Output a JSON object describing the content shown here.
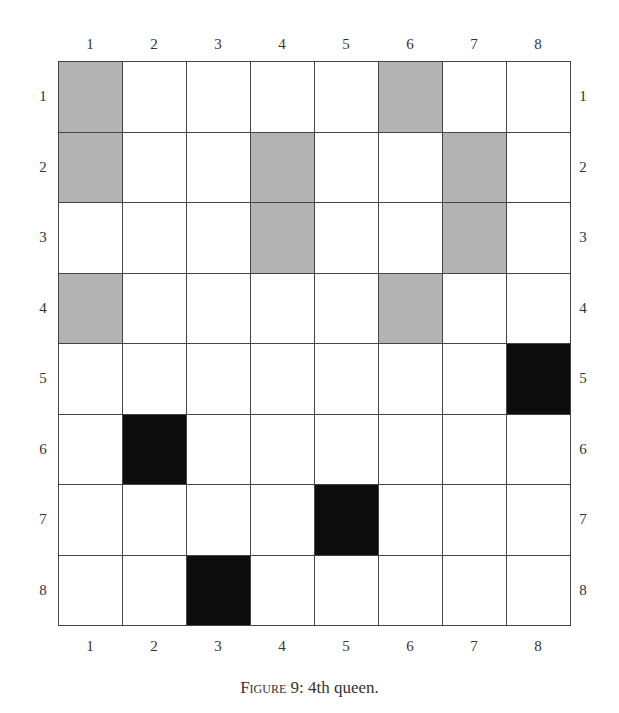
{
  "figure": {
    "caption_prefix": "Figure 9",
    "caption_rest": ": 4th queen.",
    "columns": [
      "1",
      "2",
      "3",
      "4",
      "5",
      "6",
      "7",
      "8"
    ],
    "rows": [
      "1",
      "2",
      "3",
      "4",
      "5",
      "6",
      "7",
      "8"
    ],
    "colors": {
      "gray": "#b3b3b3",
      "black": "#0d0d0d",
      "line": "#444444"
    },
    "board": [
      [
        "gray",
        "white",
        "white",
        "white",
        "white",
        "gray",
        "white",
        "white"
      ],
      [
        "gray",
        "white",
        "white",
        "gray",
        "white",
        "white",
        "gray",
        "white"
      ],
      [
        "white",
        "white",
        "white",
        "gray",
        "white",
        "white",
        "gray",
        "white"
      ],
      [
        "gray",
        "white",
        "white",
        "white",
        "white",
        "gray",
        "white",
        "white"
      ],
      [
        "white",
        "white",
        "white",
        "white",
        "white",
        "white",
        "white",
        "black"
      ],
      [
        "white",
        "black",
        "white",
        "white",
        "white",
        "white",
        "white",
        "white"
      ],
      [
        "white",
        "white",
        "white",
        "white",
        "black",
        "white",
        "white",
        "white"
      ],
      [
        "white",
        "white",
        "black",
        "white",
        "white",
        "white",
        "white",
        "white"
      ]
    ],
    "queens": [
      {
        "row": 5,
        "col": 8
      },
      {
        "row": 6,
        "col": 2
      },
      {
        "row": 7,
        "col": 5
      },
      {
        "row": 8,
        "col": 3
      }
    ],
    "attacked_cells": [
      {
        "row": 1,
        "col": 1
      },
      {
        "row": 1,
        "col": 6
      },
      {
        "row": 2,
        "col": 1
      },
      {
        "row": 2,
        "col": 4
      },
      {
        "row": 2,
        "col": 7
      },
      {
        "row": 3,
        "col": 4
      },
      {
        "row": 3,
        "col": 7
      },
      {
        "row": 4,
        "col": 1
      },
      {
        "row": 4,
        "col": 6
      }
    ]
  }
}
